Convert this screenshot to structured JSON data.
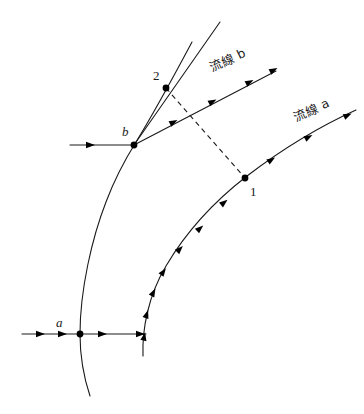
{
  "figure": {
    "background_color": "#ffffff",
    "ink_color": "#1a1a1a",
    "width": 364,
    "height": 414
  },
  "labels": {
    "streamline_a": "流線 a",
    "streamline_b": "流線 b",
    "point_a": "a",
    "point_b": "b",
    "point_1": "1",
    "point_2": "2"
  },
  "points": {
    "a": {
      "x": 80,
      "y": 334
    },
    "b": {
      "x": 134,
      "y": 145
    },
    "p1": {
      "x": 245,
      "y": 178
    },
    "p2": {
      "x": 166,
      "y": 88
    }
  },
  "label_positions": {
    "point_a": {
      "x": 58,
      "y": 327
    },
    "point_b": {
      "x": 124,
      "y": 134
    },
    "point_1": {
      "x": 252,
      "y": 194
    },
    "point_2": {
      "x": 156,
      "y": 79
    },
    "streamline_a": {
      "x": 300,
      "y": 120,
      "rotation": -25
    },
    "streamline_b": {
      "x": 214,
      "y": 70,
      "rotation": -25
    }
  },
  "geometry": {
    "streamline_a_path": "M 143,356 C 142,330 148,296 166,266 C 186,232 216,200 247,176 C 285,147 325,124 356,110",
    "streamline_b_path": "M 134,145 L 276,71",
    "left_curve_path": "M 90,396 C 84,378 80,356 80,334 C 80,290 92,238 106,202 C 115,178 126,158 136,142 C 152,116 176,72 192,42",
    "dashed_path": "M 166,88 L 245,178",
    "inlet_line_a": {
      "x1": 22,
      "y1": 334,
      "x2": 146,
      "y2": 334
    },
    "inlet_line_b": {
      "x1": 70,
      "y1": 145,
      "x2": 134,
      "y2": 145
    },
    "upper_ray": "M 134,145 L 220,22"
  },
  "arrow_counts": {
    "streamline_a": 9,
    "streamline_b": 3,
    "inlet_line_a": 4,
    "inlet_line_b": 1
  }
}
